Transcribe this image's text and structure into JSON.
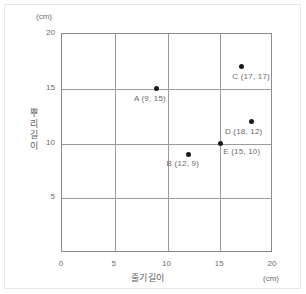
{
  "chart_data": {
    "type": "scatter",
    "title": "",
    "xlabel": "줄기길이",
    "ylabel": "뿌리길이",
    "x_unit": "(cm)",
    "y_unit": "(cm)",
    "xlim": [
      0,
      20
    ],
    "ylim": [
      0,
      20
    ],
    "xticks": [
      "0",
      "5",
      "10",
      "15",
      "20"
    ],
    "xtick_values": [
      0,
      5,
      10,
      15,
      20
    ],
    "yticks": [
      "5",
      "10",
      "15",
      "20"
    ],
    "ytick_values": [
      5,
      10,
      15,
      20
    ],
    "grid": true,
    "legend": "none",
    "points": [
      {
        "name": "A",
        "x": 9,
        "y": 15,
        "label": "A (9, 15)",
        "label_dx": -22,
        "label_dy": 6
      },
      {
        "name": "B",
        "x": 12,
        "y": 9,
        "label": "B (12, 9)",
        "label_dx": -21,
        "label_dy": 6
      },
      {
        "name": "C",
        "x": 17,
        "y": 17,
        "label": "C (17, 17)",
        "label_dx": -8,
        "label_dy": 6
      },
      {
        "name": "D",
        "x": 18,
        "y": 12,
        "label": "D (18, 12)",
        "label_dx": -26,
        "label_dy": 6
      },
      {
        "name": "E",
        "x": 15,
        "y": 10,
        "label": "E (15, 10)",
        "label_dx": 4,
        "label_dy": 4
      }
    ],
    "colors": {
      "point": "#1a1a1a",
      "grid": "#9a9a9a",
      "axis": "#8c8c8c",
      "text": "#6b6b6b",
      "background": "#ffffff"
    }
  }
}
